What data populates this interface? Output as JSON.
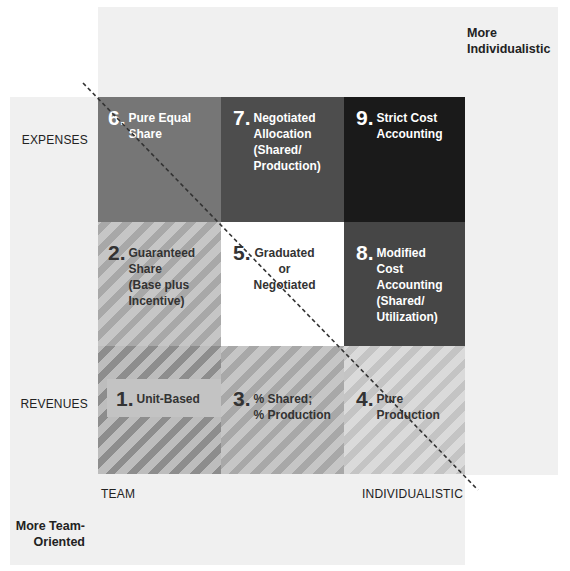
{
  "corners": {
    "top_right": [
      "More",
      "Individualistic"
    ],
    "bottom_left": [
      "More Team-",
      "Oriented"
    ]
  },
  "rows": {
    "top": "EXPENSES",
    "bottom": "REVENUES"
  },
  "columns": {
    "left": "TEAM",
    "right": "INDIVIDUALISTIC"
  },
  "cells": [
    {
      "number": "6.",
      "lines": [
        "Pure Equal",
        "Share"
      ],
      "fill": "#767676"
    },
    {
      "number": "7.",
      "lines": [
        "Negotiated",
        "Allocation",
        "(Shared/",
        "Production)"
      ],
      "fill": "#4d4d4d"
    },
    {
      "number": "9.",
      "lines": [
        "Strict Cost",
        "Accounting"
      ],
      "fill": "#1a1a1a"
    },
    {
      "number": "2.",
      "lines": [
        "Guaranteed",
        "Share",
        "(Base plus",
        "Incentive)"
      ],
      "fill": "striped-mid"
    },
    {
      "number": "5.",
      "lines": [
        "Graduated",
        "or",
        "Negotiated"
      ],
      "fill": "#ffffff"
    },
    {
      "number": "8.",
      "lines": [
        "Modified",
        "Cost",
        "Accounting",
        "(Shared/",
        "Utilization)"
      ],
      "fill": "#464646"
    },
    {
      "number": "1.",
      "lines": [
        "Unit-Based"
      ],
      "fill": "striped-dark"
    },
    {
      "number": "3.",
      "lines": [
        "% Shared;",
        "% Production"
      ],
      "fill": "striped-mid"
    },
    {
      "number": "4.",
      "lines": [
        "Pure",
        "Production"
      ],
      "fill": "striped-light"
    }
  ],
  "diagonal": {
    "style": "dashed",
    "from": [
      83,
      83
    ],
    "to": [
      478,
      490
    ]
  }
}
